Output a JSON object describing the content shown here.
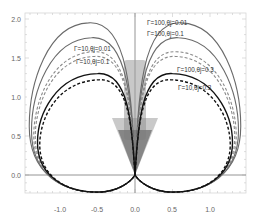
{
  "chart_data": {
    "type": "line",
    "title": "",
    "xlabel": "",
    "ylabel": "",
    "xlim": [
      -1.45,
      1.5
    ],
    "ylim": [
      -0.23,
      2.05
    ],
    "grid": false,
    "legend": "inline annotations",
    "x_ticks": [
      "-1.0",
      "-0.5",
      "0.0",
      "0.5",
      "1.0"
    ],
    "x_tick_values": [
      -1.0,
      -0.5,
      0.0,
      0.5,
      1.0
    ],
    "y_ticks": [
      "0.0",
      "0.5",
      "1.0",
      "1.5",
      "2.0"
    ],
    "y_tick_values": [
      0.0,
      0.5,
      1.0,
      1.5,
      2.0
    ],
    "series": [
      {
        "name": "Γ=100,θj=0.01",
        "style": "solid",
        "color": "#6a6a6a",
        "peak_y": 1.95,
        "peak_x": 0.62,
        "max_x": 1.41,
        "min_y": -0.22
      },
      {
        "name": "Γ=100,θj=0.1",
        "style": "solid",
        "color": "#6a6a6a",
        "peak_y": 1.76,
        "peak_x": 0.58,
        "max_x": 1.38,
        "min_y": -0.22
      },
      {
        "name": "Γ=10,θj=0.01",
        "style": "dashed",
        "color": "#8a8a8a",
        "peak_y": 1.58,
        "peak_x": 0.55,
        "max_x": 1.35,
        "min_y": -0.22
      },
      {
        "name": "Γ=10,θj=0.1",
        "style": "dashed",
        "color": "#8a8a8a",
        "peak_y": 1.52,
        "peak_x": 0.54,
        "max_x": 1.33,
        "min_y": -0.22
      },
      {
        "name": "Γ=100,θj=0.3",
        "style": "solid",
        "color": "#111111",
        "peak_y": 1.3,
        "peak_x": 0.5,
        "max_x": 1.3,
        "min_y": -0.22
      },
      {
        "name": "Γ=10,θj=0.3",
        "style": "dashed",
        "color": "#111111",
        "peak_y": 1.22,
        "peak_x": 0.48,
        "max_x": 1.27,
        "min_y": -0.22
      }
    ],
    "annotations": [
      {
        "text": "Γ=100,θj=0.01",
        "x": 0.05,
        "y": 1.93
      },
      {
        "text": "Γ=100,θj=0.1",
        "x": 0.05,
        "y": 1.79
      },
      {
        "text": "Γ=10,θj=0.01",
        "x": -0.75,
        "y": 1.6
      },
      {
        "text": "Γ=10,θj=0.1",
        "x": -0.72,
        "y": 1.45
      },
      {
        "text": "Γ=100,θj=0.3",
        "x": 0.36,
        "y": 1.28
      },
      {
        "text": "Γ=10,θj=0.3",
        "x": 0.38,
        "y": 1.04
      }
    ],
    "shaded_regions": [
      {
        "name": "jet-cone",
        "description": "gray shaded cone/column centred on x=0 from y=0 up to ~1.5",
        "color": "#777777"
      }
    ],
    "reference_lines": [
      {
        "axis": "x",
        "value": 0.0,
        "description": "vertical line x=0"
      },
      {
        "axis": "y",
        "value": 0.0,
        "description": "horizontal line y=0"
      }
    ]
  },
  "labels": {
    "x0": "-1.0",
    "x1": "-0.5",
    "x2": "0.0",
    "x3": "0.5",
    "x4": "1.0",
    "y0": "0.0",
    "y1": "0.5",
    "y2": "1.0",
    "y3": "1.5",
    "y4": "2.0",
    "a0": "Γ=100,θj=0.01",
    "a1": "Γ=100,θj=0.1",
    "a2": "Γ=10,θj=0.01",
    "a3": "Γ=10,θj=0.1",
    "a4": "Γ=100,θj=0.3",
    "a5": "Γ=10,θj=0.3"
  }
}
